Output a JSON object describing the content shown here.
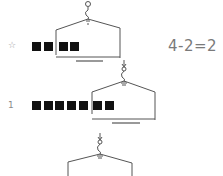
{
  "rows": [
    {
      "marker": "☆",
      "equation": "4-2=2",
      "blocks_total": 4,
      "blocks_on_scale": 2
    },
    {
      "marker": "1",
      "equation": "",
      "blocks_total": 7,
      "blocks_on_scale": 2
    },
    {
      "marker": "",
      "equation": "",
      "blocks_total": 0,
      "blocks_on_scale": 0
    }
  ],
  "colors": {
    "block": "#111111",
    "line": "#555555",
    "text": "#7a7a7a"
  }
}
